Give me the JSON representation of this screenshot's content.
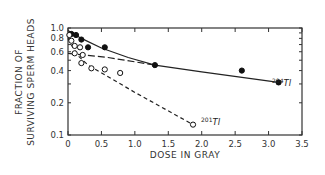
{
  "chart_data": {
    "type": "scatter",
    "title": "",
    "xlabel": "DOSE IN GRAY",
    "ylabel_lines": [
      "FRACTION OF",
      "SURVIVING SPERM HEADS"
    ],
    "xlim": [
      0,
      3.5
    ],
    "ylim": [
      0.1,
      1.0
    ],
    "yscale": "log",
    "grid": false,
    "legend": "none (inline annotations)",
    "x_ticks": [
      0,
      0.5,
      1.0,
      1.5,
      2.0,
      2.5,
      3.0,
      3.5
    ],
    "x_tick_labels": [
      "0",
      "0.5",
      "1.0",
      "1.5",
      "2.0",
      "2.5",
      "3.0",
      "3.5"
    ],
    "y_ticks": [
      0.1,
      0.2,
      0.4,
      0.6,
      0.8,
      1.0
    ],
    "y_tick_labels": [
      "0.1",
      "0.2",
      "0.4",
      "0.6",
      "0.8",
      "1.0"
    ],
    "series": [
      {
        "name": "204Tl",
        "label_mass": "204",
        "label_symbol": "Tl",
        "marker": "filled-circle",
        "points": [
          {
            "x": 0.05,
            "y": 0.88
          },
          {
            "x": 0.12,
            "y": 0.86
          },
          {
            "x": 0.2,
            "y": 0.78
          },
          {
            "x": 0.3,
            "y": 0.66
          },
          {
            "x": 0.55,
            "y": 0.66
          },
          {
            "x": 1.3,
            "y": 0.45
          },
          {
            "x": 2.6,
            "y": 0.4
          },
          {
            "x": 3.15,
            "y": 0.31
          }
        ],
        "fit_line": {
          "style": "solid",
          "points": [
            [
              0,
              0.95
            ],
            [
              0.2,
              0.8
            ],
            [
              0.5,
              0.65
            ],
            [
              0.9,
              0.53
            ],
            [
              1.3,
              0.45
            ],
            [
              2.0,
              0.39
            ],
            [
              3.15,
              0.31
            ]
          ]
        }
      },
      {
        "name": "201Tl",
        "label_mass": "201",
        "label_symbol": "Tl",
        "marker": "open-circle",
        "points": [
          {
            "x": 0.02,
            "y": 0.86
          },
          {
            "x": 0.05,
            "y": 0.76
          },
          {
            "x": 0.1,
            "y": 0.68
          },
          {
            "x": 0.18,
            "y": 0.66
          },
          {
            "x": 0.1,
            "y": 0.58
          },
          {
            "x": 0.22,
            "y": 0.56
          },
          {
            "x": 0.2,
            "y": 0.47
          },
          {
            "x": 0.35,
            "y": 0.42
          },
          {
            "x": 0.55,
            "y": 0.41
          },
          {
            "x": 0.78,
            "y": 0.38
          },
          {
            "x": 1.87,
            "y": 0.125
          }
        ],
        "fit_line": {
          "style": "dashed",
          "points": [
            [
              0,
              0.8
            ],
            [
              0.05,
              0.7
            ],
            [
              0.15,
              0.55
            ],
            [
              0.3,
              0.45
            ],
            [
              1.0,
              0.25
            ],
            [
              1.87,
              0.125
            ]
          ]
        }
      },
      {
        "name": "extrapolated",
        "marker": "none",
        "points": [],
        "fit_line": {
          "style": "long-dashed",
          "points": [
            [
              0,
              0.58
            ],
            [
              0.6,
              0.53
            ],
            [
              1.3,
              0.45
            ]
          ]
        }
      }
    ]
  }
}
